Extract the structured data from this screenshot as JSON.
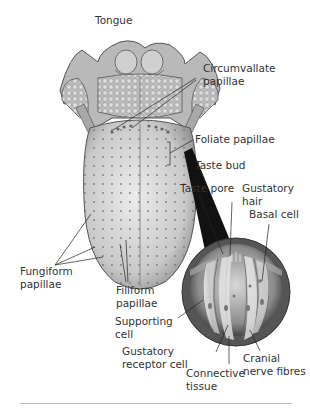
{
  "figure": {
    "title": "Tongue",
    "labels": {
      "circumvallate": [
        "Circumvallate",
        "papillae"
      ],
      "foliate": "Foliate papillae",
      "taste_bud": "Taste bud",
      "taste_pore": "Taste pore",
      "gustatory_hair": [
        "Gustatory",
        "hair"
      ],
      "basal_cell": "Basal cell",
      "fungiform": [
        "Fungiform",
        "papillae"
      ],
      "filiform": [
        "Filiform",
        "papillae"
      ],
      "supporting_cell": [
        "Supporting",
        "cell"
      ],
      "gustatory_receptor": [
        "Gustatory",
        "receptor cell"
      ],
      "connective_tissue": [
        "Connective",
        "tissue"
      ],
      "cranial_nerve": [
        "Cranial",
        "nerve fibres"
      ]
    }
  }
}
